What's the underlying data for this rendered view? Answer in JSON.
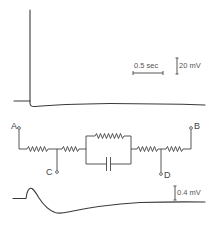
{
  "figure": {
    "top_trace": {
      "description": "Large action-potential-like spike followed by slow return to baseline",
      "scale_time": "0.5 sec",
      "scale_voltage": "20 mV"
    },
    "circuit": {
      "terminals": {
        "a": "A",
        "b": "B",
        "c": "C",
        "d": "D"
      },
      "components": [
        {
          "type": "resistor",
          "between": "A-C junction"
        },
        {
          "type": "resistor",
          "between": "C junction - parallel block"
        },
        {
          "type": "resistor",
          "position": "parallel block top"
        },
        {
          "type": "capacitor",
          "position": "parallel block bottom"
        },
        {
          "type": "resistor",
          "between": "parallel block - D junction"
        },
        {
          "type": "resistor",
          "between": "D junction - B"
        }
      ]
    },
    "bottom_trace": {
      "description": "Small positive deflection followed by prolonged negative undershoot",
      "scale_voltage": "0.4 mV"
    },
    "colors": {
      "stroke": "#3a3a3a",
      "background": "#ffffff"
    }
  }
}
